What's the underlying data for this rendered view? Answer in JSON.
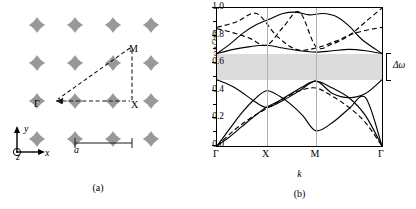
{
  "figure": {
    "panel_a": {
      "caption": "(a)",
      "labels": {
        "gamma": "Γ",
        "x_point": "X",
        "m_point": "M",
        "axis_x": "x",
        "axis_y": "y",
        "axis_z": "z",
        "lattice_constant": "a"
      },
      "structure": {
        "type": "square-lattice-air-holes-in-dielectric",
        "dielectric_color": "#999999",
        "hole_color": "#ffffff",
        "rows": 4,
        "cols": 4,
        "hole_radius_over_a": 0.42
      }
    },
    "panel_b": {
      "caption": "(b)",
      "gap_label": "Δω"
    }
  },
  "chart_data": {
    "type": "line",
    "title": "",
    "xlabel": "k",
    "ylabel": "ωa/2πc",
    "ylim": [
      0.0,
      1.0
    ],
    "yticks": [
      0.0,
      0.2,
      0.4,
      0.6,
      0.8,
      1.0
    ],
    "ytick_labels": [
      "0.0",
      "0.2",
      "0.4",
      "0.6",
      "0.8",
      "1.0"
    ],
    "xticks": [
      0.0,
      0.3,
      0.6,
      1.0
    ],
    "xtick_labels": [
      "Γ",
      "X",
      "M",
      "Γ"
    ],
    "grid": "vertical-at-symmetry-points",
    "legend": [],
    "band_gap": {
      "label": "Δω",
      "lower": 0.48,
      "upper": 0.67,
      "shade_color": "#dcdcdc"
    },
    "series": [
      {
        "name": "band-1-solid",
        "style": "solid",
        "x": [
          0.0,
          0.08,
          0.15,
          0.22,
          0.3,
          0.38,
          0.45,
          0.52,
          0.6,
          0.7,
          0.8,
          0.9,
          1.0
        ],
        "values": [
          0.0,
          0.07,
          0.14,
          0.21,
          0.28,
          0.33,
          0.38,
          0.43,
          0.47,
          0.42,
          0.35,
          0.22,
          0.0
        ]
      },
      {
        "name": "band-2-solid",
        "style": "solid",
        "x": [
          0.0,
          0.08,
          0.15,
          0.22,
          0.3,
          0.38,
          0.45,
          0.52,
          0.6,
          0.7,
          0.8,
          0.9,
          1.0
        ],
        "values": [
          0.0,
          0.13,
          0.24,
          0.33,
          0.4,
          0.36,
          0.3,
          0.22,
          0.11,
          0.17,
          0.27,
          0.35,
          0.0
        ]
      },
      {
        "name": "band-3-solid",
        "style": "solid",
        "x": [
          0.0,
          0.08,
          0.15,
          0.22,
          0.3,
          0.4,
          0.5,
          0.6,
          0.7,
          0.8,
          0.9,
          1.0
        ],
        "values": [
          0.48,
          0.44,
          0.39,
          0.33,
          0.28,
          0.33,
          0.4,
          0.47,
          0.38,
          0.35,
          0.38,
          0.48
        ]
      },
      {
        "name": "band-4-dashed",
        "style": "dashed",
        "x": [
          0.0,
          0.1,
          0.2,
          0.3,
          0.4,
          0.5,
          0.6,
          0.7,
          0.8,
          0.9,
          1.0
        ],
        "values": [
          0.0,
          0.11,
          0.2,
          0.27,
          0.34,
          0.4,
          0.42,
          0.36,
          0.28,
          0.17,
          0.0
        ]
      },
      {
        "name": "band-5-solid",
        "style": "solid",
        "x": [
          0.0,
          0.1,
          0.2,
          0.3,
          0.4,
          0.5,
          0.6,
          0.7,
          0.8,
          0.9,
          1.0
        ],
        "values": [
          0.67,
          0.7,
          0.72,
          0.73,
          0.71,
          0.69,
          0.68,
          0.69,
          0.7,
          0.69,
          0.67
        ]
      },
      {
        "name": "band-6-solid",
        "style": "solid",
        "x": [
          0.0,
          0.08,
          0.16,
          0.24,
          0.32,
          0.4,
          0.48,
          0.56,
          0.64,
          0.72,
          0.8,
          0.88,
          1.0
        ],
        "values": [
          0.67,
          0.74,
          0.82,
          0.88,
          0.92,
          0.96,
          0.97,
          0.95,
          0.96,
          0.94,
          0.87,
          0.77,
          0.67
        ]
      },
      {
        "name": "band-7-dashed",
        "style": "dashed",
        "x": [
          0.0,
          0.1,
          0.2,
          0.3,
          0.4,
          0.5,
          0.6,
          0.7,
          0.8,
          0.9,
          1.0
        ],
        "values": [
          0.85,
          0.82,
          0.78,
          0.73,
          0.86,
          0.97,
          0.72,
          0.74,
          0.8,
          0.9,
          1.0
        ]
      },
      {
        "name": "band-8-dashed",
        "style": "dashed",
        "x": [
          0.0,
          0.12,
          0.24,
          0.36,
          0.48,
          0.6,
          0.72,
          0.84,
          1.0
        ],
        "values": [
          0.86,
          0.9,
          0.96,
          0.8,
          0.7,
          0.71,
          0.76,
          0.82,
          0.86
        ]
      }
    ]
  }
}
